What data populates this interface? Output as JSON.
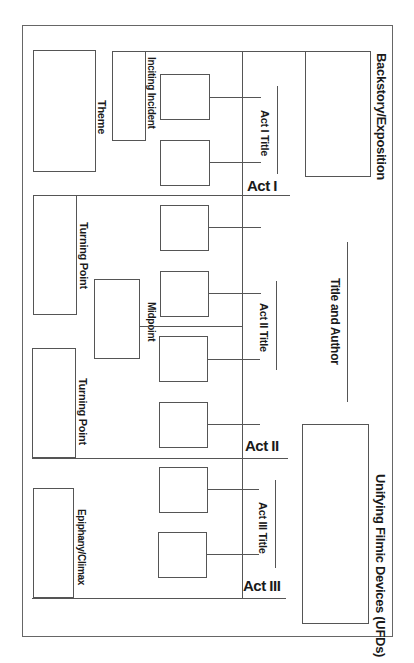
{
  "diagram": {
    "orientation": "rotated 90deg clockwise (landscape worksheet printed on portrait page)",
    "sections": {
      "backstory": {
        "label": "Backstory/Exposition"
      },
      "title_author": {
        "label": "Title and Author"
      },
      "ufds": {
        "label": "Unifying Filmic Devices (UFDs)"
      },
      "theme": {
        "label": "Theme"
      },
      "inciting_incident": {
        "label": "Inciting Incident"
      },
      "turning_point_1": {
        "label": "Turning Point"
      },
      "midpoint": {
        "label": "Midpoint"
      },
      "turning_point_2": {
        "label": "Turning Point"
      },
      "climax": {
        "label": "Epiphany/Climax"
      }
    },
    "acts": [
      {
        "label": "Act I",
        "title_label": "Act I Title",
        "scene_boxes": 2
      },
      {
        "label": "Act II",
        "title_label": "Act II Title",
        "scene_boxes": 4
      },
      {
        "label": "Act III",
        "title_label": "Act III Title",
        "scene_boxes": 2
      }
    ]
  }
}
